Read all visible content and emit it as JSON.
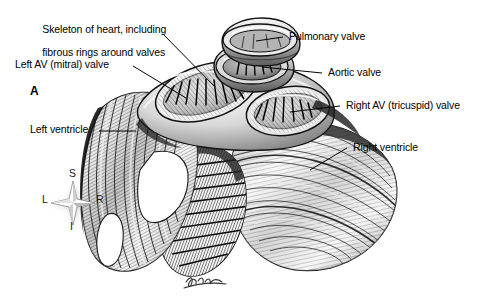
{
  "figure": {
    "panel_letter": "A",
    "background_color": "#ffffff",
    "ink_color": "#000000",
    "style": "pen-and-ink stipple anatomical illustration, grayscale",
    "signature": "artist signature"
  },
  "labels": [
    {
      "id": "skeleton-of-heart",
      "line1": "Skeleton of heart, including",
      "line2": "fibrous rings around valves"
    },
    {
      "id": "left-av-mitral-valve",
      "text": "Left AV (mitral) valve"
    },
    {
      "id": "left-ventricle",
      "text": "Left ventricle"
    },
    {
      "id": "pulmonary-valve",
      "text": "Pulmonary valve"
    },
    {
      "id": "aortic-valve",
      "text": "Aortic valve"
    },
    {
      "id": "right-av-tricuspid-valve",
      "text": "Right AV (tricuspid) valve"
    },
    {
      "id": "right-ventricle",
      "text": "Right ventricle"
    }
  ],
  "orientation_compass": {
    "superior": "S",
    "inferior": "I",
    "left": "L",
    "right": "R"
  }
}
